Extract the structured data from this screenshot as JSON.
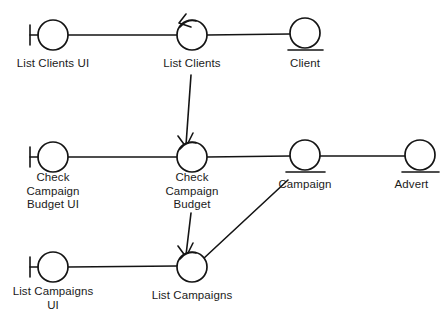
{
  "diagram": {
    "type": "uml-robustness-diagram",
    "canvas": {
      "width": 447,
      "height": 321,
      "background": "#ffffff"
    },
    "stroke_color": "#141414",
    "text_color": "#1b1b1b",
    "nodes": [
      {
        "id": "list-clients-ui",
        "stereotype": "boundary",
        "label": "List Clients UI",
        "cx": 53,
        "cy": 35,
        "r": 15,
        "label_x": 0,
        "label_y": 57,
        "label_w": 106
      },
      {
        "id": "list-clients",
        "stereotype": "control",
        "label": "List Clients",
        "cx": 192,
        "cy": 35,
        "r": 15,
        "label_x": 140,
        "label_y": 57,
        "label_w": 104
      },
      {
        "id": "client",
        "stereotype": "entity",
        "label": "Client",
        "cx": 305,
        "cy": 33,
        "r": 15,
        "label_x": 259,
        "label_y": 57,
        "label_w": 92
      },
      {
        "id": "check-campaign-budget-ui",
        "stereotype": "boundary",
        "label": "Check\nCampaign\nBudget UI",
        "cx": 53,
        "cy": 157,
        "r": 15,
        "label_x": 0,
        "label_y": 171,
        "label_w": 106
      },
      {
        "id": "check-campaign-budget",
        "stereotype": "control",
        "label": "Check\nCampaign\nBudget",
        "cx": 192,
        "cy": 157,
        "r": 15,
        "label_x": 140,
        "label_y": 171,
        "label_w": 104
      },
      {
        "id": "campaign",
        "stereotype": "entity",
        "label": "Campaign",
        "cx": 305,
        "cy": 155,
        "r": 15,
        "label_x": 259,
        "label_y": 178,
        "label_w": 92
      },
      {
        "id": "advert",
        "stereotype": "entity",
        "label": "Advert",
        "cx": 420,
        "cy": 155,
        "r": 15,
        "label_x": 376,
        "label_y": 178,
        "label_w": 71
      },
      {
        "id": "list-campaigns-ui",
        "stereotype": "boundary",
        "label": "List Campaigns\nUI",
        "cx": 53,
        "cy": 267,
        "r": 15,
        "label_x": 0,
        "label_y": 285,
        "label_w": 106
      },
      {
        "id": "list-campaigns",
        "stereotype": "control",
        "label": "List Campaigns",
        "cx": 192,
        "cy": 267,
        "r": 15,
        "label_x": 126,
        "label_y": 289,
        "label_w": 132
      }
    ],
    "connectors": [
      {
        "id": "link-list-clients-ui-to-list-clients",
        "kind": "line",
        "from": "list-clients-ui",
        "to": "list-clients",
        "d": "M 68 35 L 177 35"
      },
      {
        "id": "link-list-clients-to-client",
        "kind": "line",
        "from": "list-clients",
        "to": "client",
        "d": "M 207 35 L 290 34"
      },
      {
        "id": "link-check-budget-ui-to-check-budget",
        "kind": "line",
        "from": "check-campaign-budget-ui",
        "to": "check-campaign-budget",
        "d": "M 68 157 L 177 157"
      },
      {
        "id": "link-check-budget-to-campaign",
        "kind": "line",
        "from": "check-campaign-budget",
        "to": "campaign",
        "d": "M 207 157 L 290 156"
      },
      {
        "id": "link-campaign-to-advert",
        "kind": "line",
        "from": "campaign",
        "to": "advert",
        "d": "M 320 156 L 405 156"
      },
      {
        "id": "link-list-campaigns-ui-to-list-campaigns",
        "kind": "line",
        "from": "list-campaigns-ui",
        "to": "list-campaigns",
        "d": "M 68 267 L 177 266"
      },
      {
        "id": "arrow-list-clients-to-check-budget",
        "kind": "arrow",
        "from": "list-clients",
        "to": "check-campaign-budget",
        "d": "M 191 75 L 186 145"
      },
      {
        "id": "arrow-check-budget-to-list-campaigns",
        "kind": "arrow",
        "from": "check-campaign-budget",
        "to": "list-campaigns",
        "d": "M 191 213 L 186 255"
      },
      {
        "id": "arrow-campaign-to-list-campaigns",
        "kind": "arrow",
        "from": "campaign",
        "to": "list-campaigns",
        "d": "M 288 180 L 203 259"
      }
    ]
  }
}
